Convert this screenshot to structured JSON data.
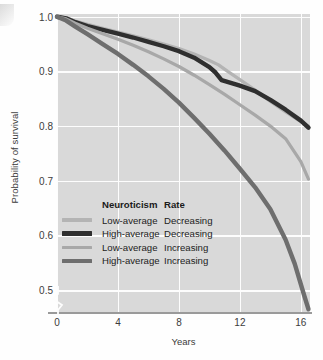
{
  "figure": {
    "corner_artifact": "page-edge-artifact"
  },
  "axes": {
    "y_title": "Probability of survival",
    "x_title": "Years",
    "y_ticks": [
      "1.0",
      "0.9",
      "0.8",
      "0.7",
      "0.6",
      "0.5"
    ],
    "x_ticks": [
      "0",
      "4",
      "8",
      "12",
      "16"
    ],
    "axis_break_symbol": "y-axis-break"
  },
  "legend": {
    "header_neuroticism": "Neuroticism",
    "header_rate": "Rate",
    "entries": [
      {
        "neuroticism": "Low-average",
        "rate": "Decreasing",
        "color": "#b4b4b4",
        "width": 3.2
      },
      {
        "neuroticism": "High-average",
        "rate": "Decreasing",
        "color": "#2f2f2f",
        "width": 4.4
      },
      {
        "neuroticism": "Low-average",
        "rate": "Increasing",
        "color": "#a8a8a8",
        "width": 3.2
      },
      {
        "neuroticism": "High-average",
        "rate": "Increasing",
        "color": "#6e6e6e",
        "width": 4.4
      }
    ]
  },
  "colors": {
    "plot_background": "#d9d9d9",
    "gridline": "#fdfdfd",
    "axis_line": "#9a9a9a",
    "text": "#3c3c3c"
  },
  "chart_data": {
    "type": "line",
    "title": "",
    "xlabel": "Years",
    "ylabel": "Probability of survival",
    "xlim": [
      0,
      16.6
    ],
    "ylim": [
      0.46,
      1.005
    ],
    "grid": true,
    "legend_position": "inside-lower-left",
    "xticks": [
      0,
      4,
      8,
      12,
      16
    ],
    "yticks": [
      1.0,
      0.9,
      0.8,
      0.7,
      0.6,
      0.5
    ],
    "series": [
      {
        "name": "Low-average Decreasing",
        "neuroticism": "Low-average",
        "rate": "Decreasing",
        "color": "#b4b4b4",
        "linewidth": 3.2,
        "x": [
          0,
          0.6,
          1.2,
          2,
          3,
          4,
          5,
          6,
          7,
          8,
          9,
          10,
          10.6,
          11.2,
          12,
          13,
          14,
          15,
          16,
          16.5
        ],
        "y": [
          1.0,
          0.998,
          0.992,
          0.986,
          0.979,
          0.972,
          0.965,
          0.958,
          0.95,
          0.942,
          0.932,
          0.92,
          0.912,
          0.9,
          0.885,
          0.866,
          0.845,
          0.826,
          0.808,
          0.8
        ]
      },
      {
        "name": "High-average Decreasing",
        "neuroticism": "High-average",
        "rate": "Decreasing",
        "color": "#2f2f2f",
        "linewidth": 4.4,
        "x": [
          0,
          0.6,
          1.2,
          2,
          3,
          4,
          5,
          6,
          7,
          8,
          9,
          10,
          10.4,
          10.8,
          11.4,
          12,
          13,
          14,
          15,
          16,
          16.5
        ],
        "y": [
          1.0,
          0.997,
          0.99,
          0.983,
          0.976,
          0.969,
          0.962,
          0.954,
          0.946,
          0.937,
          0.925,
          0.908,
          0.898,
          0.884,
          0.879,
          0.874,
          0.864,
          0.848,
          0.83,
          0.81,
          0.797
        ]
      },
      {
        "name": "Low-average Increasing",
        "neuroticism": "Low-average",
        "rate": "Increasing",
        "color": "#a8a8a8",
        "linewidth": 3.2,
        "x": [
          0,
          0.6,
          1.2,
          2,
          3,
          4,
          5,
          6,
          7,
          8,
          9,
          10,
          11,
          12,
          13,
          14,
          15,
          16,
          16.5
        ],
        "y": [
          1.0,
          0.996,
          0.988,
          0.979,
          0.969,
          0.959,
          0.948,
          0.936,
          0.923,
          0.909,
          0.893,
          0.876,
          0.858,
          0.839,
          0.82,
          0.8,
          0.777,
          0.735,
          0.703
        ]
      },
      {
        "name": "High-average Increasing",
        "neuroticism": "High-average",
        "rate": "Increasing",
        "color": "#6e6e6e",
        "linewidth": 4.4,
        "x": [
          0,
          0.6,
          1.2,
          2,
          3,
          4,
          5,
          6,
          7,
          8,
          9,
          10,
          11,
          12,
          13,
          14,
          15,
          15.6,
          16.2,
          16.5
        ],
        "y": [
          1.0,
          0.993,
          0.982,
          0.968,
          0.95,
          0.932,
          0.912,
          0.891,
          0.868,
          0.843,
          0.815,
          0.786,
          0.755,
          0.722,
          0.688,
          0.648,
          0.592,
          0.548,
          0.492,
          0.465
        ]
      }
    ]
  }
}
